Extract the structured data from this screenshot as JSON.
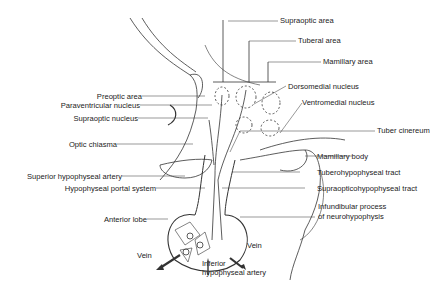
{
  "diagram": {
    "labels": {
      "supraoptic_area": "Supraoptic area",
      "tuberal_area": "Tuberal area",
      "mamillary_area": "Mamillary area",
      "dorsomedial_nucleus": "Dorsomedial nucleus",
      "ventromedial_nucleus": "Ventromedial nucleus",
      "tuber_cinereum": "Tuber cinereum",
      "mamillary_body": "Mamillary body",
      "tuberohypophyseal_tract": "Tuberohypophyseal tract",
      "supraopticohypophyseal_tract": "Supraopticohypophyseal tract",
      "infundibular_process_1": "Infundibular process",
      "infundibular_process_2": "of neurohypophysis",
      "preoptic_area": "Preoptic area",
      "paraventricular_nucleus": "Paraventricular nucleus",
      "supraoptic_nucleus": "Supraoptic nucleus",
      "optic_chiasma": "Optic chiasma",
      "superior_hypophyseal_artery": "Superior hypophyseal artery",
      "hypophyseal_portal_system": "Hypophyseal portal system",
      "anterior_lobe": "Anterior lobe",
      "vein_left": "Vein",
      "vein_right": "Vein",
      "inferior_artery_1": "Inferior",
      "inferior_artery_2": "hypophyseal artery"
    }
  }
}
